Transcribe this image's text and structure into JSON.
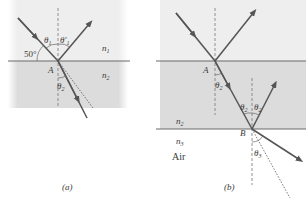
{
  "panel_a": {
    "caption": "(a)",
    "angle_label": "50°",
    "theta1": "θ",
    "theta1_sub": "1",
    "theta1p": "θ′",
    "theta1p_sub": "1",
    "theta2": "θ",
    "theta2_sub": "2",
    "point": "A",
    "n1": "n",
    "n1_sub": "1",
    "n2": "n",
    "n2_sub": "2"
  },
  "panel_b": {
    "caption": "(b)",
    "point_a": "A",
    "point_b": "B",
    "theta2": "θ",
    "theta2_sub": "2",
    "theta3": "θ",
    "theta3_sub": "3",
    "n2": "n",
    "n2_sub": "2",
    "n3": "n",
    "n3_sub": "3",
    "air": "Air"
  },
  "colors": {
    "medium2": "#dedede",
    "medium1": "#ececec",
    "ray": "#555555",
    "interface": "#6a6a6a"
  }
}
